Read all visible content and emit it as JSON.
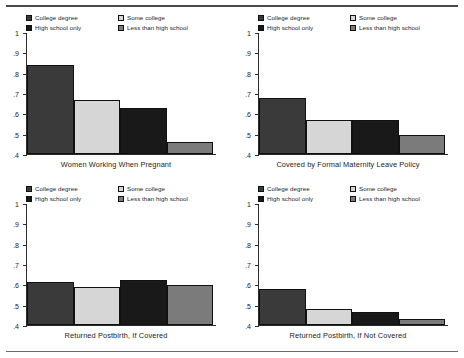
{
  "figure": {
    "background": "#ffffff",
    "rule_color": "#4a4a4a"
  },
  "legend": {
    "entries": [
      {
        "label": "College degree",
        "color": "#3a3a3a"
      },
      {
        "label": "Some college",
        "color": "#d6d6d6"
      },
      {
        "label": "High school only",
        "color": "#191919"
      },
      {
        "label": "Less than high school",
        "color": "#7b7b7b"
      }
    ]
  },
  "axis": {
    "ticks": [
      "1",
      ".9",
      ".8",
      ".7",
      ".6",
      ".5",
      ".4"
    ],
    "values": [
      1,
      0.9,
      0.8,
      0.7,
      0.6,
      0.5,
      0.4
    ],
    "min": 0.4,
    "max": 1.0
  },
  "chart_data": {
    "type": "bar",
    "title": "",
    "xlabel": "",
    "ylabel": "",
    "ylim": [
      0.4,
      1.0
    ],
    "yticks": [
      0.4,
      0.5,
      0.6,
      0.7,
      0.8,
      0.9,
      1.0
    ],
    "ytick_labels": [
      ".4",
      ".5",
      ".6",
      ".7",
      ".8",
      ".9",
      "1"
    ],
    "grid": false,
    "legend_position": "top",
    "categories": [
      "College degree",
      "Some college",
      "High school only",
      "Less than high school"
    ],
    "category_colors": [
      "#3a3a3a",
      "#d6d6d6",
      "#191919",
      "#7b7b7b"
    ],
    "panels": [
      {
        "title": "Women Working When Pregnant",
        "values": [
          0.84,
          0.667,
          0.628,
          0.458
        ]
      },
      {
        "title": "Covered by Formal Maternity Leave Policy",
        "values": [
          0.675,
          0.565,
          0.568,
          0.495
        ]
      },
      {
        "title": "Returned Postbirth, If Covered",
        "values": [
          0.61,
          0.585,
          0.623,
          0.595
        ]
      },
      {
        "title": "Returned Postbirth, If Not Covered",
        "values": [
          0.578,
          0.48,
          0.465,
          0.428
        ]
      }
    ]
  }
}
